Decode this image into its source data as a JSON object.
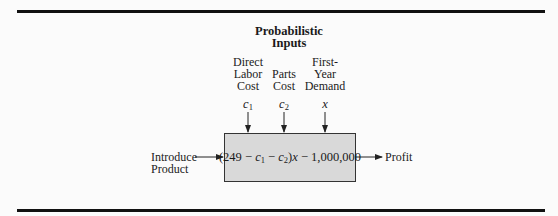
{
  "title": {
    "line1": "Probabilistic",
    "line2": "Inputs"
  },
  "inputs": [
    {
      "label_lines": [
        "Direct",
        "Labor",
        "Cost"
      ],
      "variable": "c",
      "subscript": "1"
    },
    {
      "label_lines": [
        "Parts",
        "Cost"
      ],
      "variable": "c",
      "subscript": "2"
    },
    {
      "label_lines": [
        "First-",
        "Year",
        "Demand"
      ],
      "variable": "x",
      "subscript": ""
    }
  ],
  "decision": {
    "line1": "Introduce",
    "line2": "Product"
  },
  "model": {
    "open": "(249 − ",
    "c1": "c",
    "c1_sub": "1",
    "minus": " − ",
    "c2": "c",
    "c2_sub": "2",
    "close": ")",
    "x": "x",
    "tail": " − 1,000,000"
  },
  "output": {
    "label": "Profit"
  },
  "colors": {
    "box_fill": "#d9d9d9",
    "rule": "#111111",
    "background": "#fbfbfb"
  }
}
